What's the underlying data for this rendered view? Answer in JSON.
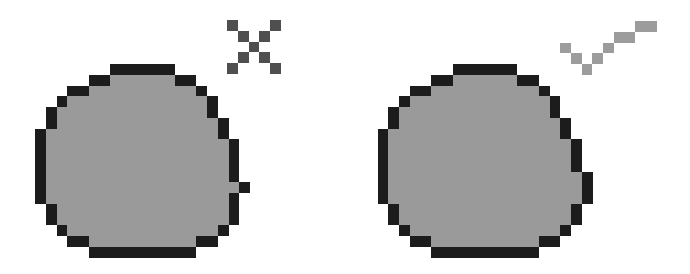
{
  "scene": {
    "background": "#ffffff",
    "cell_size": 10.75
  },
  "colors": {
    "outline": "#1c1c1c",
    "fill": "#9a9a9a",
    "cross": "#4f4f4f",
    "check": "#9c9c9c"
  },
  "panels": [
    {
      "id": "incorrect",
      "label": "Incorrect shape",
      "shape": {
        "origin": [
          35,
          64
        ],
        "outline_runs": [
          [
            0,
            7,
            12
          ],
          [
            1,
            5,
            6
          ],
          [
            1,
            13,
            14
          ],
          [
            2,
            3,
            4
          ],
          [
            2,
            15,
            15
          ],
          [
            3,
            2,
            2
          ],
          [
            3,
            16,
            16
          ],
          [
            4,
            1,
            1
          ],
          [
            4,
            16,
            16
          ],
          [
            5,
            1,
            1
          ],
          [
            5,
            17,
            17
          ],
          [
            6,
            0,
            0
          ],
          [
            6,
            17,
            17
          ],
          [
            7,
            0,
            0
          ],
          [
            7,
            18,
            18
          ],
          [
            8,
            0,
            0
          ],
          [
            8,
            18,
            18
          ],
          [
            9,
            0,
            0
          ],
          [
            9,
            18,
            18
          ],
          [
            10,
            0,
            0
          ],
          [
            10,
            18,
            18
          ],
          [
            11,
            0,
            0
          ],
          [
            11,
            19,
            19
          ],
          [
            12,
            0,
            0
          ],
          [
            12,
            18,
            18
          ],
          [
            13,
            1,
            1
          ],
          [
            13,
            18,
            18
          ],
          [
            14,
            1,
            1
          ],
          [
            14,
            18,
            18
          ],
          [
            15,
            2,
            2
          ],
          [
            15,
            17,
            17
          ],
          [
            16,
            3,
            4
          ],
          [
            16,
            15,
            16
          ],
          [
            17,
            5,
            14
          ]
        ],
        "fill_runs": [
          [
            1,
            7,
            12
          ],
          [
            2,
            5,
            14
          ],
          [
            3,
            3,
            15
          ],
          [
            4,
            2,
            15
          ],
          [
            5,
            2,
            16
          ],
          [
            6,
            1,
            16
          ],
          [
            7,
            1,
            17
          ],
          [
            8,
            1,
            17
          ],
          [
            9,
            1,
            17
          ],
          [
            10,
            1,
            17
          ],
          [
            11,
            1,
            18
          ],
          [
            12,
            1,
            17
          ],
          [
            13,
            2,
            17
          ],
          [
            14,
            2,
            17
          ],
          [
            15,
            3,
            16
          ],
          [
            16,
            5,
            14
          ]
        ]
      },
      "mark": {
        "type": "cross",
        "icon_name": "cross-icon",
        "label": "Wrong",
        "origin": [
          227,
          20
        ],
        "cells": [
          [
            0,
            0
          ],
          [
            0,
            4
          ],
          [
            1,
            1
          ],
          [
            1,
            3
          ],
          [
            2,
            2
          ],
          [
            3,
            1
          ],
          [
            3,
            3
          ],
          [
            4,
            0
          ],
          [
            4,
            4
          ]
        ]
      }
    },
    {
      "id": "correct",
      "label": "Correct shape",
      "shape": {
        "origin": [
          377.5,
          64
        ],
        "outline_runs": [
          [
            0,
            7,
            12
          ],
          [
            1,
            5,
            6
          ],
          [
            1,
            13,
            14
          ],
          [
            2,
            3,
            4
          ],
          [
            2,
            15,
            15
          ],
          [
            3,
            2,
            2
          ],
          [
            3,
            16,
            16
          ],
          [
            4,
            1,
            1
          ],
          [
            4,
            16,
            16
          ],
          [
            5,
            1,
            1
          ],
          [
            5,
            17,
            17
          ],
          [
            6,
            0,
            0
          ],
          [
            6,
            17,
            17
          ],
          [
            7,
            0,
            0
          ],
          [
            7,
            18,
            18
          ],
          [
            8,
            0,
            0
          ],
          [
            8,
            18,
            18
          ],
          [
            9,
            0,
            0
          ],
          [
            9,
            18,
            18
          ],
          [
            10,
            0,
            0
          ],
          [
            10,
            19,
            19
          ],
          [
            11,
            0,
            0
          ],
          [
            11,
            19,
            19
          ],
          [
            12,
            0,
            0
          ],
          [
            12,
            19,
            19
          ],
          [
            13,
            1,
            1
          ],
          [
            13,
            18,
            18
          ],
          [
            14,
            1,
            1
          ],
          [
            14,
            18,
            18
          ],
          [
            15,
            2,
            2
          ],
          [
            15,
            17,
            17
          ],
          [
            16,
            3,
            4
          ],
          [
            16,
            15,
            16
          ],
          [
            17,
            5,
            14
          ]
        ],
        "fill_runs": [
          [
            1,
            7,
            12
          ],
          [
            2,
            5,
            14
          ],
          [
            3,
            3,
            15
          ],
          [
            4,
            2,
            15
          ],
          [
            5,
            2,
            16
          ],
          [
            6,
            1,
            16
          ],
          [
            7,
            1,
            17
          ],
          [
            8,
            1,
            17
          ],
          [
            9,
            1,
            17
          ],
          [
            10,
            1,
            18
          ],
          [
            11,
            1,
            18
          ],
          [
            12,
            1,
            18
          ],
          [
            13,
            2,
            17
          ],
          [
            14,
            2,
            17
          ],
          [
            15,
            3,
            16
          ],
          [
            16,
            5,
            14
          ]
        ]
      },
      "mark": {
        "type": "check",
        "icon_name": "checkmark-icon",
        "label": "Right",
        "origin": [
          560,
          21
        ],
        "cells": [
          [
            2,
            0
          ],
          [
            3,
            1
          ],
          [
            4,
            2
          ],
          [
            3,
            3
          ],
          [
            2,
            4
          ],
          [
            1,
            5
          ],
          [
            1,
            6
          ],
          [
            0,
            7
          ],
          [
            0,
            8
          ]
        ]
      }
    }
  ]
}
